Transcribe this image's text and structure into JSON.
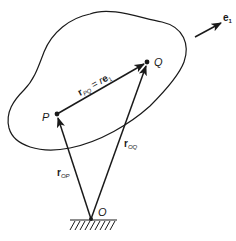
{
  "figure": {
    "points": {
      "P": {
        "label": "P",
        "x": 57,
        "y": 114
      },
      "Q": {
        "label": "Q",
        "x": 147,
        "y": 62
      },
      "O": {
        "label": "O",
        "x": 91,
        "y": 219
      }
    },
    "vectors": {
      "r_PQ": {
        "base": "r",
        "sub": "PQ",
        "eq": " = ",
        "rhs_r": "r",
        "rhs_e": "e",
        "rhs_sub": "1"
      },
      "r_OP": {
        "base": "r",
        "sub": "OP"
      },
      "r_OQ": {
        "base": "r",
        "sub": "OQ"
      }
    },
    "unit_vector": {
      "base": "e",
      "sub": "1"
    },
    "colors": {
      "stroke": "#1a1a1a",
      "background": "#ffffff"
    }
  }
}
